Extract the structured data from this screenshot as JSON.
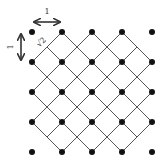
{
  "diagram": {
    "labels": {
      "horizontal_spacing": "1",
      "vertical_spacing": "1",
      "diagonal_spacing": "√2"
    },
    "colors": {
      "dot": "#111111",
      "line": "#555555",
      "arrow": "#333333"
    },
    "grid": {
      "columns_x": [
        32,
        62,
        92,
        122,
        152
      ],
      "rows_y": [
        32,
        62,
        92,
        122,
        152
      ],
      "dot_radius": 3
    },
    "lines": [
      {
        "x1": 62,
        "y1": 32,
        "x2": 32,
        "y2": 62
      },
      {
        "x1": 92,
        "y1": 32,
        "x2": 32,
        "y2": 92
      },
      {
        "x1": 122,
        "y1": 32,
        "x2": 32,
        "y2": 122
      },
      {
        "x1": 137,
        "y1": 47,
        "x2": 47,
        "y2": 137
      },
      {
        "x1": 152,
        "y1": 62,
        "x2": 62,
        "y2": 152
      },
      {
        "x1": 152,
        "y1": 92,
        "x2": 92,
        "y2": 152
      },
      {
        "x1": 152,
        "y1": 122,
        "x2": 122,
        "y2": 152
      },
      {
        "x1": 47,
        "y1": 47,
        "x2": 137,
        "y2": 137
      },
      {
        "x1": 62,
        "y1": 32,
        "x2": 152,
        "y2": 122
      },
      {
        "x1": 92,
        "y1": 32,
        "x2": 152,
        "y2": 92
      },
      {
        "x1": 122,
        "y1": 32,
        "x2": 152,
        "y2": 62
      },
      {
        "x1": 32,
        "y1": 62,
        "x2": 122,
        "y2": 152
      },
      {
        "x1": 32,
        "y1": 92,
        "x2": 92,
        "y2": 152
      },
      {
        "x1": 32,
        "y1": 122,
        "x2": 62,
        "y2": 152
      }
    ]
  }
}
